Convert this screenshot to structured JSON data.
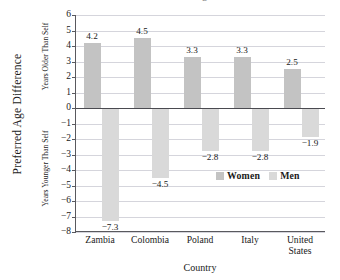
{
  "chart_data": {
    "type": "bar",
    "title": "Preferred Age Difference",
    "xlabel": "Country",
    "ylabel": "Preferred Age Difference",
    "ylabel_upper": "Years Older Than Self",
    "ylabel_lower": "Years Younger Than Self",
    "categories": [
      "Zambia",
      "Colombia",
      "Poland",
      "Italy",
      "United States"
    ],
    "series": [
      {
        "name": "Women",
        "values": [
          4.2,
          4.5,
          3.3,
          3.3,
          2.5
        ],
        "color": "#c3c3c3"
      },
      {
        "name": "Men",
        "values": [
          -7.3,
          -4.5,
          -2.8,
          -2.8,
          -1.9
        ],
        "color": "#d9d9d9"
      }
    ],
    "ylim": [
      -8,
      6
    ],
    "yticks": [
      6,
      5,
      4,
      3,
      2,
      1,
      0,
      -1,
      -2,
      -3,
      -4,
      -5,
      -6,
      -7,
      -8
    ],
    "ytick_labels": [
      "6",
      "5",
      "4",
      "3",
      "2",
      "1",
      "0",
      "−1",
      "−2",
      "−3",
      "−4",
      "−5",
      "−6",
      "−7",
      "−8"
    ],
    "data_labels": {
      "women": [
        "4.2",
        "4.5",
        "3.3",
        "3.3",
        "2.5"
      ],
      "men": [
        "−7.3",
        "−4.5",
        "−2.8",
        "−2.8",
        "−1.9"
      ]
    },
    "category_labels": [
      [
        "Zambia"
      ],
      [
        "Colombia"
      ],
      [
        "Poland"
      ],
      [
        "Italy"
      ],
      [
        "United",
        "States"
      ]
    ],
    "grid": true,
    "legend_position": "inside-lower-right",
    "zero_line": true
  },
  "legend": {
    "entries": [
      {
        "label": "Women",
        "color": "#c3c3c3"
      },
      {
        "label": "Men",
        "color": "#d9d9d9"
      }
    ]
  },
  "colors": {
    "women": "#c3c3c3",
    "men": "#d9d9d9",
    "gridline": "#d5d5dc",
    "axis": "#59595e",
    "zero_line": "#4a4a50",
    "text": "#1a1a1a"
  }
}
